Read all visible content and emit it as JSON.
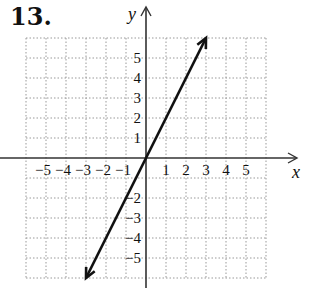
{
  "problem_number": "13.",
  "chart_data": {
    "type": "line",
    "title": "",
    "xlabel": "x",
    "ylabel": "y",
    "xlim": [
      -6,
      6
    ],
    "ylim": [
      -6,
      6
    ],
    "grid": true,
    "x_tick_labels": [
      "−5",
      "−4",
      "−3",
      "−2",
      "−1",
      "1",
      "2",
      "3",
      "4",
      "5"
    ],
    "y_tick_labels": [
      "5",
      "4",
      "3",
      "2",
      "1",
      "−2",
      "−3",
      "−4",
      "−5"
    ],
    "series": [
      {
        "name": "y = 2x",
        "x": [
          -3,
          3
        ],
        "y": [
          -6,
          6
        ],
        "arrows": "both"
      }
    ]
  }
}
